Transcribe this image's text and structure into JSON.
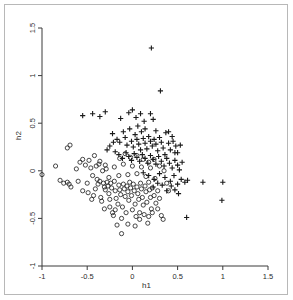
{
  "figure": {
    "border_color": "#b8b8b8",
    "background": "#ffffff",
    "axis_color": "#3a3a3a",
    "marker_color": "#1a1a1a"
  },
  "labels": {
    "xlabel": "h1",
    "ylabel": "h2"
  },
  "chart_data": {
    "type": "scatter",
    "title": "",
    "xlabel": "h1",
    "ylabel": "h2",
    "xlim": [
      -1,
      1.5
    ],
    "ylim": [
      -1,
      1.5
    ],
    "xticks": [
      -1,
      -0.5,
      0,
      0.5,
      1,
      1.5
    ],
    "xticklabels": [
      "-1",
      "-0.5",
      "0",
      "0.5",
      "1",
      "1.5"
    ],
    "yticks": [
      -1,
      -0.5,
      0,
      0.5,
      1,
      1.5
    ],
    "yticklabels": [
      "-1",
      "-0.5",
      "0",
      "0.5",
      "1",
      "1.5"
    ],
    "grid": false,
    "legend": "none",
    "series": [
      {
        "name": "group-circle",
        "marker": "o",
        "color": "#1a1a1a",
        "points": [
          [
            -1.0,
            -0.04
          ],
          [
            -0.85,
            0.05
          ],
          [
            -0.72,
            0.24
          ],
          [
            -0.69,
            0.27
          ],
          [
            -0.8,
            -0.1
          ],
          [
            -0.76,
            -0.13
          ],
          [
            -0.72,
            -0.12
          ],
          [
            -0.7,
            -0.14
          ],
          [
            -0.68,
            -0.17
          ],
          [
            -0.62,
            0.02
          ],
          [
            -0.6,
            -0.11
          ],
          [
            -0.58,
            0.09
          ],
          [
            -0.55,
            0.12
          ],
          [
            -0.52,
            0.06
          ],
          [
            -0.5,
            -0.13
          ],
          [
            -0.48,
            0.11
          ],
          [
            -0.46,
            0.03
          ],
          [
            -0.45,
            -0.3
          ],
          [
            -0.43,
            -0.26
          ],
          [
            -0.42,
            0.16
          ],
          [
            -0.4,
            0.05
          ],
          [
            -0.39,
            -0.09
          ],
          [
            -0.38,
            -0.14
          ],
          [
            -0.37,
            0.07
          ],
          [
            -0.36,
            -0.11
          ],
          [
            -0.35,
            -0.28
          ],
          [
            -0.34,
            -0.32
          ],
          [
            -0.33,
            0.0
          ],
          [
            -0.32,
            -0.13
          ],
          [
            -0.31,
            -0.17
          ],
          [
            -0.3,
            -0.2
          ],
          [
            -0.29,
            0.02
          ],
          [
            -0.28,
            -0.12
          ],
          [
            -0.27,
            -0.16
          ],
          [
            -0.26,
            -0.24
          ],
          [
            -0.25,
            -0.3
          ],
          [
            -0.24,
            -0.13
          ],
          [
            -0.23,
            -0.18
          ],
          [
            -0.22,
            -0.44
          ],
          [
            -0.21,
            -0.47
          ],
          [
            -0.2,
            -0.11
          ],
          [
            -0.19,
            -0.21
          ],
          [
            -0.18,
            -0.29
          ],
          [
            -0.17,
            -0.57
          ],
          [
            -0.16,
            -0.35
          ],
          [
            -0.15,
            -0.15
          ],
          [
            -0.14,
            -0.2
          ],
          [
            -0.13,
            -0.25
          ],
          [
            -0.12,
            -0.66
          ],
          [
            -0.11,
            -0.38
          ],
          [
            -0.1,
            -0.14
          ],
          [
            -0.09,
            -0.19
          ],
          [
            -0.08,
            -0.27
          ],
          [
            -0.07,
            -0.44
          ],
          [
            -0.06,
            -0.16
          ],
          [
            -0.05,
            -0.22
          ],
          [
            -0.04,
            -0.31
          ],
          [
            -0.03,
            -0.12
          ],
          [
            -0.02,
            -0.18
          ],
          [
            -0.01,
            -0.26
          ],
          [
            0.0,
            -0.41
          ],
          [
            0.01,
            -0.14
          ],
          [
            0.02,
            -0.21
          ],
          [
            0.03,
            -0.35
          ],
          [
            0.04,
            -0.48
          ],
          [
            0.05,
            -0.17
          ],
          [
            0.06,
            -0.24
          ],
          [
            0.07,
            -0.3
          ],
          [
            0.08,
            -0.51
          ],
          [
            0.09,
            -0.13
          ],
          [
            0.1,
            -0.19
          ],
          [
            0.11,
            -0.28
          ],
          [
            0.12,
            -0.36
          ],
          [
            0.13,
            -0.46
          ],
          [
            0.14,
            -0.16
          ],
          [
            0.15,
            -0.22
          ],
          [
            0.16,
            -0.33
          ],
          [
            0.17,
            -0.55
          ],
          [
            0.18,
            -0.12
          ],
          [
            0.19,
            -0.2
          ],
          [
            0.2,
            -0.28
          ],
          [
            0.21,
            -0.4
          ],
          [
            0.22,
            -0.18
          ],
          [
            0.24,
            -0.26
          ],
          [
            0.26,
            -0.34
          ],
          [
            0.28,
            -0.21
          ],
          [
            0.3,
            -0.29
          ],
          [
            0.32,
            -0.47
          ],
          [
            0.34,
            -0.51
          ],
          [
            -0.55,
            -0.21
          ],
          [
            -0.49,
            -0.23
          ],
          [
            -0.44,
            -0.05
          ],
          [
            -0.41,
            -0.19
          ],
          [
            -0.36,
            0.1
          ],
          [
            -0.3,
            0.06
          ],
          [
            -0.26,
            -0.07
          ],
          [
            -0.2,
            0.04
          ],
          [
            -0.15,
            -0.05
          ],
          [
            -0.1,
            0.07
          ],
          [
            -0.05,
            -0.04
          ],
          [
            0.0,
            0.05
          ],
          [
            0.05,
            -0.03
          ],
          [
            0.1,
            0.04
          ],
          [
            0.15,
            -0.06
          ],
          [
            0.2,
            0.03
          ],
          [
            0.25,
            -0.08
          ],
          [
            0.3,
            0.05
          ],
          [
            0.12,
            0.12
          ],
          [
            0.05,
            0.16
          ],
          [
            -0.02,
            0.14
          ],
          [
            -0.08,
            0.18
          ],
          [
            -0.14,
            0.13
          ],
          [
            0.18,
            0.09
          ],
          [
            0.24,
            0.12
          ],
          [
            0.35,
            0.0
          ],
          [
            0.38,
            -0.13
          ],
          [
            0.4,
            -0.21
          ],
          [
            -0.12,
            -0.5
          ],
          [
            -0.05,
            -0.56
          ],
          [
            0.03,
            -0.58
          ],
          [
            0.08,
            -0.44
          ],
          [
            -0.19,
            -0.41
          ],
          [
            -0.25,
            -0.38
          ],
          [
            -0.31,
            -0.4
          ],
          [
            0.22,
            -0.44
          ],
          [
            0.28,
            -0.4
          ],
          [
            0.18,
            -0.48
          ]
        ]
      },
      {
        "name": "group-plus",
        "marker": "+",
        "color": "#1a1a1a",
        "points": [
          [
            0.21,
            1.29
          ],
          [
            0.31,
            0.84
          ],
          [
            -0.55,
            0.58
          ],
          [
            -0.44,
            0.6
          ],
          [
            -0.36,
            0.57
          ],
          [
            -0.3,
            0.62
          ],
          [
            -0.13,
            0.55
          ],
          [
            -0.04,
            0.61
          ],
          [
            0.0,
            0.64
          ],
          [
            0.04,
            0.56
          ],
          [
            0.09,
            0.6
          ],
          [
            0.13,
            0.52
          ],
          [
            0.2,
            0.6
          ],
          [
            0.23,
            0.54
          ],
          [
            -0.22,
            0.39
          ],
          [
            -0.17,
            0.33
          ],
          [
            -0.14,
            0.3
          ],
          [
            -0.1,
            0.41
          ],
          [
            -0.08,
            0.35
          ],
          [
            -0.06,
            0.27
          ],
          [
            -0.03,
            0.44
          ],
          [
            -0.01,
            0.31
          ],
          [
            0.01,
            0.25
          ],
          [
            0.03,
            0.38
          ],
          [
            0.05,
            0.33
          ],
          [
            0.07,
            0.28
          ],
          [
            0.09,
            0.22
          ],
          [
            0.1,
            0.41
          ],
          [
            0.12,
            0.34
          ],
          [
            0.14,
            0.29
          ],
          [
            0.16,
            0.23
          ],
          [
            0.18,
            0.36
          ],
          [
            0.2,
            0.31
          ],
          [
            0.22,
            0.26
          ],
          [
            0.24,
            0.33
          ],
          [
            0.26,
            0.28
          ],
          [
            0.28,
            0.21
          ],
          [
            0.3,
            0.35
          ],
          [
            0.32,
            0.3
          ],
          [
            0.34,
            0.24
          ],
          [
            0.37,
            0.4
          ],
          [
            0.4,
            0.29
          ],
          [
            0.42,
            0.22
          ],
          [
            0.45,
            0.31
          ],
          [
            0.48,
            0.26
          ],
          [
            0.5,
            0.19
          ],
          [
            0.53,
            0.27
          ],
          [
            -0.19,
            0.2
          ],
          [
            -0.15,
            0.17
          ],
          [
            -0.11,
            0.13
          ],
          [
            -0.07,
            0.19
          ],
          [
            -0.04,
            0.15
          ],
          [
            -0.01,
            0.11
          ],
          [
            0.02,
            0.18
          ],
          [
            0.05,
            0.14
          ],
          [
            0.08,
            0.1
          ],
          [
            0.11,
            0.17
          ],
          [
            0.14,
            0.13
          ],
          [
            0.17,
            0.08
          ],
          [
            0.2,
            0.16
          ],
          [
            0.23,
            0.12
          ],
          [
            0.26,
            0.07
          ],
          [
            0.29,
            0.15
          ],
          [
            0.32,
            0.1
          ],
          [
            0.35,
            0.05
          ],
          [
            0.38,
            0.13
          ],
          [
            0.41,
            0.08
          ],
          [
            0.44,
            0.03
          ],
          [
            0.47,
            0.11
          ],
          [
            0.5,
            0.06
          ],
          [
            0.52,
            0.01
          ],
          [
            0.55,
            0.09
          ],
          [
            0.12,
            -0.02
          ],
          [
            0.18,
            -0.05
          ],
          [
            0.24,
            -0.09
          ],
          [
            0.3,
            -0.03
          ],
          [
            0.36,
            -0.07
          ],
          [
            0.42,
            -0.11
          ],
          [
            0.46,
            -0.05
          ],
          [
            0.5,
            -0.14
          ],
          [
            0.54,
            -0.09
          ],
          [
            0.58,
            -0.12
          ],
          [
            0.61,
            -0.1
          ],
          [
            0.78,
            -0.12
          ],
          [
            1.0,
            -0.12
          ],
          [
            0.99,
            -0.31
          ],
          [
            0.6,
            -0.49
          ],
          [
            0.51,
            -0.24
          ],
          [
            0.47,
            -0.2
          ],
          [
            0.43,
            -0.16
          ],
          [
            0.38,
            -0.21
          ],
          [
            0.33,
            -0.15
          ],
          [
            0.28,
            -0.13
          ],
          [
            0.23,
            -0.17
          ],
          [
            0.4,
            0.41
          ],
          [
            0.44,
            0.36
          ],
          [
            0.06,
            0.47
          ],
          [
            0.14,
            0.44
          ],
          [
            0.26,
            0.42
          ],
          [
            -0.25,
            0.26
          ],
          [
            -0.28,
            0.22
          ],
          [
            -0.21,
            0.3
          ],
          [
            0.36,
            0.17
          ],
          [
            0.47,
            0.19
          ]
        ]
      }
    ]
  }
}
